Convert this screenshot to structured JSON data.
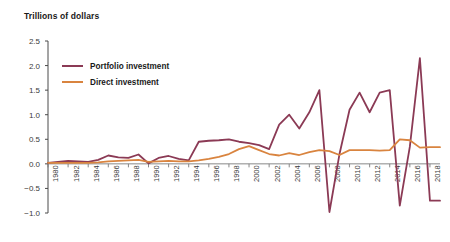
{
  "chart_data": {
    "type": "line",
    "title": "Trillions of dollars",
    "xlabel": "",
    "ylabel": "",
    "ylim": [
      -1.0,
      2.5
    ],
    "ytick_labels": [
      "2.5",
      "2.0",
      "1.5",
      "1.0",
      "0.5",
      "0.0",
      "−0.5",
      "−1.0"
    ],
    "ytick_values": [
      2.5,
      2.0,
      1.5,
      1.0,
      0.5,
      0.0,
      -0.5,
      -1.0
    ],
    "grid": false,
    "legend_position": "upper-left-inside",
    "x": [
      1980,
      1981,
      1982,
      1983,
      1984,
      1985,
      1986,
      1987,
      1988,
      1989,
      1990,
      1991,
      1992,
      1993,
      1994,
      1995,
      1996,
      1997,
      1998,
      1999,
      2000,
      2001,
      2002,
      2003,
      2004,
      2005,
      2006,
      2007,
      2008,
      2009,
      2010,
      2011,
      2012,
      2013,
      2014,
      2015,
      2016,
      2017,
      2018,
      2019
    ],
    "xtick_labels": [
      "1980",
      "1982",
      "1984",
      "1986",
      "1988",
      "1990",
      "1992",
      "1994",
      "1996",
      "1998",
      "2000",
      "2002",
      "2004",
      "2006",
      "2008",
      "2010",
      "2012",
      "2014",
      "2016",
      "2018"
    ],
    "xtick_values": [
      1980,
      1982,
      1984,
      1986,
      1988,
      1990,
      1992,
      1994,
      1996,
      1998,
      2000,
      2002,
      2004,
      2006,
      2008,
      2010,
      2012,
      2014,
      2016,
      2018
    ],
    "series": [
      {
        "name": "Portfolio investment",
        "color": "#8B3A55",
        "values": [
          0.02,
          0.04,
          0.06,
          0.05,
          0.04,
          0.08,
          0.17,
          0.13,
          0.12,
          0.19,
          0.01,
          0.12,
          0.16,
          0.1,
          0.07,
          0.45,
          0.47,
          0.48,
          0.5,
          0.45,
          0.42,
          0.38,
          0.3,
          0.8,
          1.0,
          0.72,
          1.05,
          1.5,
          -0.98,
          0.2,
          1.1,
          1.45,
          1.05,
          1.45,
          1.5,
          -0.85,
          0.35,
          2.15,
          -0.75,
          -0.75
        ]
      },
      {
        "name": "Direct investment",
        "color": "#D9843F",
        "values": [
          0.02,
          0.02,
          0.02,
          0.02,
          0.02,
          0.03,
          0.05,
          0.06,
          0.07,
          0.08,
          0.04,
          0.05,
          0.06,
          0.05,
          0.05,
          0.07,
          0.1,
          0.14,
          0.2,
          0.3,
          0.36,
          0.28,
          0.2,
          0.17,
          0.22,
          0.18,
          0.24,
          0.28,
          0.26,
          0.18,
          0.28,
          0.28,
          0.28,
          0.27,
          0.28,
          0.5,
          0.48,
          0.33,
          0.34,
          0.34
        ]
      }
    ]
  },
  "legend": {
    "items": [
      {
        "label": "Portfolio investment",
        "color": "#8B3A55"
      },
      {
        "label": "Direct investment",
        "color": "#D9843F"
      }
    ]
  }
}
